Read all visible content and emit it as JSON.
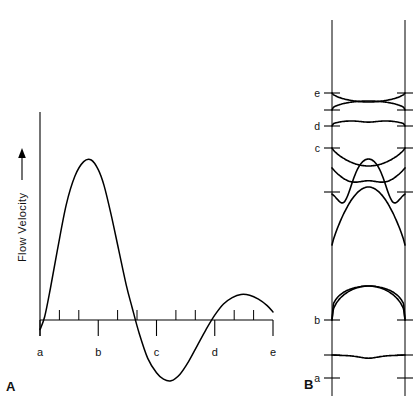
{
  "figure": {
    "panels": [
      {
        "letter": "A",
        "name": "flow-velocity-waveform"
      },
      {
        "letter": "B",
        "name": "velocity-profiles"
      }
    ]
  },
  "panel_a": {
    "letter": "A",
    "y_axis_label": "Flow Velocity",
    "y_axis_arrow": "up-arrow",
    "tick_labels": [
      "a",
      "b",
      "c",
      "d",
      "e"
    ]
  },
  "panel_b": {
    "letter": "B",
    "tick_labels": [
      "a",
      "b",
      "c",
      "d",
      "e"
    ]
  },
  "chart_data": [
    {
      "type": "line",
      "name": "flow-velocity-waveform",
      "title": "",
      "xlabel": "",
      "ylabel": "Flow Velocity",
      "panel": "A",
      "categories": [
        "a",
        "b",
        "c",
        "d",
        "e"
      ],
      "category_x": [
        0,
        1,
        2,
        3,
        4
      ],
      "xlim": [
        0,
        4
      ],
      "ylim": [
        -0.42,
        1.05
      ],
      "grid": false,
      "legend": null,
      "minor_ticks_per_interval": 2,
      "x": [
        0.0,
        0.08,
        0.18,
        0.3,
        0.45,
        0.6,
        0.75,
        0.88,
        1.0,
        1.1,
        1.22,
        1.35,
        1.48,
        1.58,
        1.7,
        1.85,
        2.0,
        2.12,
        2.25,
        2.4,
        2.55,
        2.7,
        2.85,
        3.0,
        3.15,
        3.3,
        3.45,
        3.6,
        3.75,
        3.9,
        4.0
      ],
      "y": [
        -0.06,
        0.02,
        0.2,
        0.44,
        0.72,
        0.9,
        0.99,
        1.0,
        0.94,
        0.84,
        0.66,
        0.44,
        0.22,
        0.08,
        -0.08,
        -0.24,
        -0.33,
        -0.37,
        -0.38,
        -0.34,
        -0.26,
        -0.16,
        -0.06,
        0.03,
        0.1,
        0.14,
        0.16,
        0.155,
        0.13,
        0.09,
        0.05
      ]
    },
    {
      "type": "line",
      "name": "velocity-profiles-across-vessel",
      "title": "",
      "panel": "B",
      "description": "Velocity profiles across the vessel lumen at successive instants of the cardiac cycle",
      "wall_positions": {
        "left": 0.0,
        "right": 1.0
      },
      "labeled_profiles": [
        "a",
        "b",
        "c",
        "d",
        "e"
      ],
      "profiles": [
        {
          "label": "a",
          "baseline": 355,
          "shape": "blunt-flat-slightly-negative",
          "peak_amplitude": 4
        },
        {
          "label": "",
          "baseline": 320,
          "shape": "blunt-plug-forward",
          "peak_amplitude": 34
        },
        {
          "label": "b",
          "baseline": 320,
          "shape": "rounded-plug-forward",
          "peak_amplitude": 34
        },
        {
          "label": "",
          "baseline": 245,
          "shape": "tall-parabolic-forward",
          "peak_amplitude": 58
        },
        {
          "label": "",
          "baseline": 192,
          "shape": "forward-core-reverse-near-wall",
          "peak_amplitude": 28
        },
        {
          "label": "",
          "baseline": 168,
          "shape": "reverse-core-forward-near-wall",
          "peak_amplitude": -22
        },
        {
          "label": "c",
          "baseline": 148,
          "shape": "reverse-dish",
          "peak_amplitude": -18
        },
        {
          "label": "d",
          "baseline": 126,
          "shape": "shallow-wavy-flat",
          "peak_amplitude": 7
        },
        {
          "label": "",
          "baseline": 110,
          "shape": "shallow-forward-arc",
          "peak_amplitude": 9
        },
        {
          "label": "e",
          "baseline": 93,
          "shape": "shallow-reverse-dish",
          "peak_amplitude": -9
        }
      ]
    }
  ],
  "colors": {
    "background": "#ffffff",
    "ink": "#000000",
    "text": "#111111"
  }
}
